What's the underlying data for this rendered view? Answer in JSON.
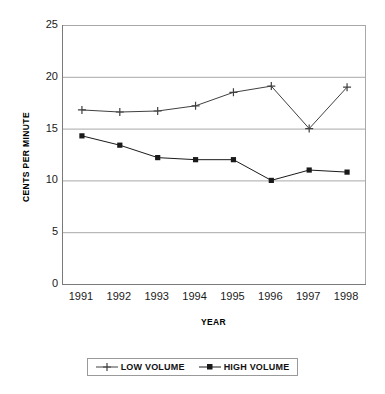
{
  "chart_data": {
    "type": "line",
    "title": "",
    "xlabel": "YEAR",
    "ylabel": "CENTS PER MINUTE",
    "categories": [
      "1991",
      "1992",
      "1993",
      "1994",
      "1995",
      "1996",
      "1997",
      "1998"
    ],
    "x": [
      1991,
      1992,
      1993,
      1994,
      1995,
      1996,
      1997,
      1998
    ],
    "series": [
      {
        "name": "LOW VOLUME",
        "marker": "plus",
        "color": "#404040",
        "values": [
          16.8,
          16.6,
          16.7,
          17.2,
          18.5,
          19.1,
          15.0,
          19.0
        ]
      },
      {
        "name": "HIGH VOLUME",
        "marker": "square",
        "color": "#1a1a1a",
        "values": [
          14.3,
          13.4,
          12.2,
          12.0,
          12.0,
          10.0,
          11.0,
          10.8
        ]
      }
    ],
    "ylim": [
      0,
      25
    ],
    "yticks": [
      0,
      5,
      10,
      15,
      20,
      25
    ],
    "ytick_labels": [
      "0",
      "5",
      "10",
      "15",
      "20",
      "25"
    ],
    "grid": true,
    "grid_axis": "y",
    "grid_color": "#a8a8a8",
    "axis_color": "#7a7a7a",
    "legend_position": "bottom",
    "legend_entries": [
      "LOW VOLUME",
      "HIGH VOLUME"
    ],
    "background": "#ffffff"
  }
}
